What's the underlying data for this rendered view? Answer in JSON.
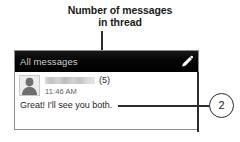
{
  "annotation": {
    "caption_lines": [
      "Number of messages",
      "in thread"
    ],
    "callout_number": "2"
  },
  "phone_screen": {
    "title_bar": {
      "label": "All messages",
      "compose_icon": "pencil-icon",
      "background_color": "#000000",
      "text_color": "#cfcfcf"
    },
    "thread": {
      "avatar_icon": "contact-avatar-silhouette",
      "sender_name": "",
      "sender_name_redacted": true,
      "message_count": "(5)",
      "timestamp": "11:46 AM",
      "preview_text": "Great! I'll see you both."
    }
  }
}
